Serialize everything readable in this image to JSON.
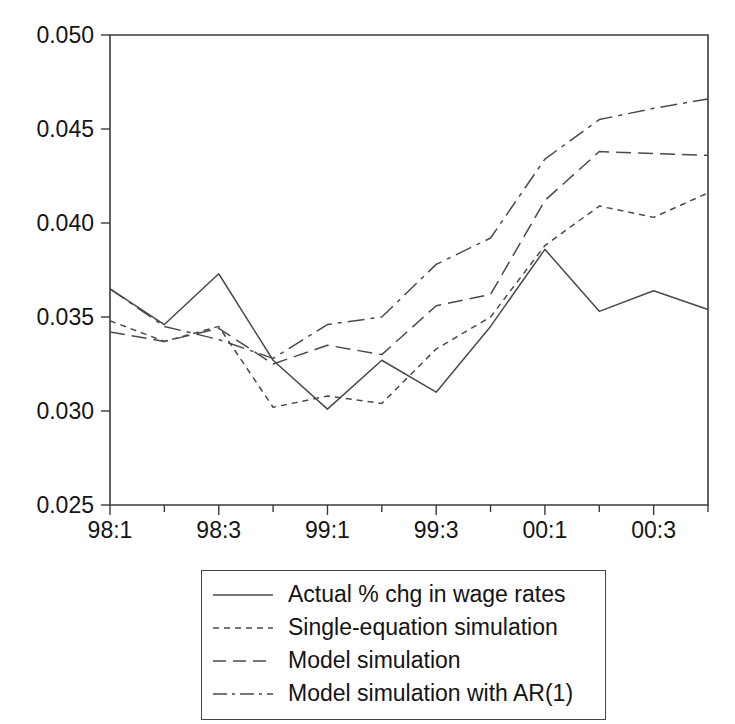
{
  "chart_data": {
    "type": "line",
    "title": "",
    "xlabel": "",
    "ylabel": "",
    "grid": false,
    "legend_position": "bottom",
    "ylim": [
      0.025,
      0.05
    ],
    "ytick_labels": [
      "0.050",
      "0.045",
      "0.040",
      "0.035",
      "0.030",
      "0.025"
    ],
    "ytick_values": [
      0.05,
      0.045,
      0.04,
      0.035,
      0.03,
      0.025
    ],
    "x": [
      "98:1",
      "98:2",
      "98:3",
      "98:4",
      "99:1",
      "99:2",
      "99:3",
      "99:4",
      "00:1",
      "00:2",
      "00:3",
      "00:4"
    ],
    "xtick_labels": [
      "98:1",
      "98:3",
      "99:1",
      "99:3",
      "00:1",
      "00:3"
    ],
    "xtick_indices": [
      0,
      2,
      4,
      6,
      8,
      10
    ],
    "series": [
      {
        "name": "Actual % chg in wage rates",
        "style": "solid",
        "values": [
          0.0365,
          0.0346,
          0.0373,
          0.0327,
          0.0301,
          0.0327,
          0.031,
          0.0345,
          0.0386,
          0.0353,
          0.0364,
          0.0354
        ]
      },
      {
        "name": "Single-equation simulation",
        "style": "dotted",
        "values": [
          0.0348,
          0.0337,
          0.0345,
          0.0302,
          0.0308,
          0.0304,
          0.0333,
          0.035,
          0.0388,
          0.0409,
          0.0403,
          0.0416
        ]
      },
      {
        "name": "Model simulation",
        "style": "dashed",
        "values": [
          0.0342,
          0.0337,
          0.0344,
          0.0325,
          0.0335,
          0.033,
          0.0356,
          0.0362,
          0.0412,
          0.0438,
          0.0437,
          0.0436
        ]
      },
      {
        "name": "Model simulation with AR(1)",
        "style": "dashdot",
        "values": [
          0.0365,
          0.0345,
          0.0338,
          0.0328,
          0.0346,
          0.035,
          0.0378,
          0.0392,
          0.0434,
          0.0455,
          0.0461,
          0.0466
        ]
      }
    ]
  },
  "legend": {
    "entries": [
      {
        "label": "Actual % chg in wage rates",
        "style": "solid"
      },
      {
        "label": "Single-equation simulation",
        "style": "dotted"
      },
      {
        "label": "Model simulation",
        "style": "dashed"
      },
      {
        "label": "Model simulation with AR(1)",
        "style": "dashdot"
      }
    ]
  },
  "colors": {
    "line": "#4a4a4a",
    "axis": "#3b3b3b",
    "text": "#141414",
    "background": "#ffffff"
  }
}
